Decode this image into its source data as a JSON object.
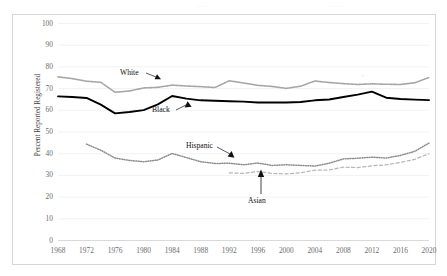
{
  "figure": {
    "border_color": "#d6d6d6",
    "background": "#ffffff",
    "ghost_artifacts": [
      {
        "name": "ghost-text-left",
        "text": "....."
      },
      {
        "name": "ghost-text-right",
        "text": "......."
      },
      {
        "name": "ghost-mark",
        "text": "o"
      }
    ]
  },
  "chart_data": {
    "type": "line",
    "title": "",
    "xlabel": "",
    "ylabel": "Percent Reported Registered",
    "xlim": [
      1968,
      2020
    ],
    "ylim": [
      0,
      100
    ],
    "ytick_step": 10,
    "grid": "horizontal",
    "legend_position": "inline-annotations",
    "x": [
      1968,
      1970,
      1972,
      1974,
      1976,
      1978,
      1980,
      1982,
      1984,
      1986,
      1988,
      1990,
      1992,
      1994,
      1996,
      1998,
      2000,
      2002,
      2004,
      2006,
      2008,
      2010,
      2012,
      2014,
      2016,
      2018,
      2020
    ],
    "tick_labels": [
      "1968",
      "1972",
      "1976",
      "1980",
      "1984",
      "1988",
      "1992",
      "1996",
      "2000",
      "2004",
      "2008",
      "2012",
      "2016",
      "2020"
    ],
    "ytick_labels": [
      "100",
      "90",
      "80",
      "70",
      "60",
      "50",
      "40",
      "30",
      "20",
      "10",
      "0"
    ],
    "series": [
      {
        "name": "White",
        "label": "White",
        "color": "#a6a6a6",
        "style": "dotted-thick",
        "x": [
          1968,
          1970,
          1972,
          1974,
          1976,
          1978,
          1980,
          1982,
          1984,
          1986,
          1988,
          1990,
          1992,
          1994,
          1996,
          1998,
          2000,
          2002,
          2004,
          2006,
          2008,
          2010,
          2012,
          2014,
          2016,
          2018,
          2020
        ],
        "values": [
          75.4,
          74.6,
          73.4,
          72.9,
          68.3,
          68.9,
          70.3,
          70.6,
          71.6,
          71.2,
          70.9,
          70.5,
          73.6,
          72.6,
          71.5,
          71.0,
          70.1,
          71.1,
          73.5,
          72.8,
          72.3,
          71.9,
          72.2,
          72.0,
          71.9,
          72.7,
          75.1
        ]
      },
      {
        "name": "Black",
        "label": "Black",
        "color": "#000000",
        "style": "solid-thick",
        "x": [
          1968,
          1970,
          1972,
          1974,
          1976,
          1978,
          1980,
          1982,
          1984,
          1986,
          1988,
          1990,
          1992,
          1994,
          1996,
          1998,
          2000,
          2002,
          2004,
          2006,
          2008,
          2010,
          2012,
          2014,
          2016,
          2018,
          2020
        ],
        "values": [
          66.4,
          66.1,
          65.7,
          62.6,
          58.6,
          59.2,
          60.1,
          62.7,
          66.6,
          65.4,
          64.6,
          64.4,
          64.2,
          64.0,
          63.6,
          63.6,
          63.6,
          63.8,
          64.6,
          65.0,
          66.1,
          67.2,
          68.6,
          65.8,
          65.2,
          64.9,
          64.7
        ]
      },
      {
        "name": "Hispanic",
        "label": "Hispanic",
        "color": "#8d8d8d",
        "style": "dotted",
        "x": [
          1972,
          1974,
          1976,
          1978,
          1980,
          1982,
          1984,
          1986,
          1988,
          1990,
          1992,
          1994,
          1996,
          1998,
          2000,
          2002,
          2004,
          2006,
          2008,
          2010,
          2012,
          2014,
          2016,
          2018,
          2020
        ],
        "values": [
          44.4,
          41.6,
          38.0,
          36.9,
          36.3,
          37.1,
          40.1,
          38.2,
          36.3,
          35.5,
          35.6,
          34.9,
          35.7,
          34.6,
          34.9,
          34.6,
          34.3,
          35.6,
          37.6,
          37.9,
          38.4,
          38.0,
          39.2,
          41.1,
          44.9
        ]
      },
      {
        "name": "Asian",
        "label": "Asian",
        "color": "#b5b5b5",
        "style": "dashed",
        "x": [
          1992,
          1994,
          1996,
          1998,
          2000,
          2002,
          2004,
          2006,
          2008,
          2010,
          2012,
          2014,
          2016,
          2018,
          2020
        ],
        "values": [
          31.2,
          30.9,
          31.8,
          30.9,
          30.7,
          31.2,
          32.4,
          32.5,
          33.8,
          33.6,
          34.4,
          34.9,
          36.0,
          37.4,
          40.0
        ]
      }
    ],
    "annotations": [
      {
        "name": "white-callout",
        "text": "White"
      },
      {
        "name": "black-callout",
        "text": "Black"
      },
      {
        "name": "hispanic-callout",
        "text": "Hispanic"
      },
      {
        "name": "asian-callout",
        "text": "Asian"
      }
    ]
  }
}
